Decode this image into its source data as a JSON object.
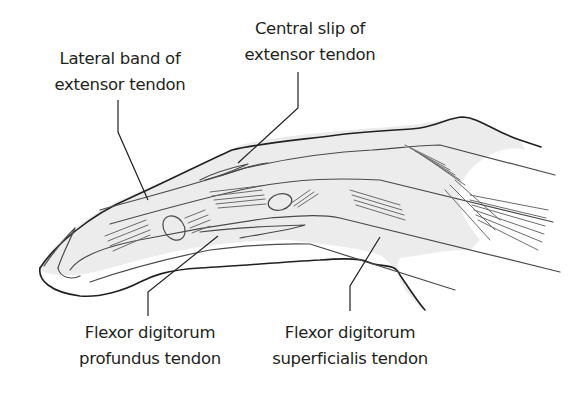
{
  "diagram": {
    "colors": {
      "line": "#231f20",
      "fill": "#ececec",
      "fiber": "#6b6b6b",
      "background": "#ffffff"
    },
    "labels": [
      {
        "id": "lateral-band",
        "line1": "Lateral band of",
        "line2": "extensor tendon",
        "position": "top-left"
      },
      {
        "id": "central-slip",
        "line1": "Central slip of",
        "line2": "extensor tendon",
        "position": "top-center"
      },
      {
        "id": "fdp",
        "line1": "Flexor digitorum",
        "line2": "profundus tendon",
        "position": "bottom-left"
      },
      {
        "id": "fds",
        "line1": "Flexor digitorum",
        "line2": "superficialis tendon",
        "position": "bottom-center"
      }
    ]
  }
}
